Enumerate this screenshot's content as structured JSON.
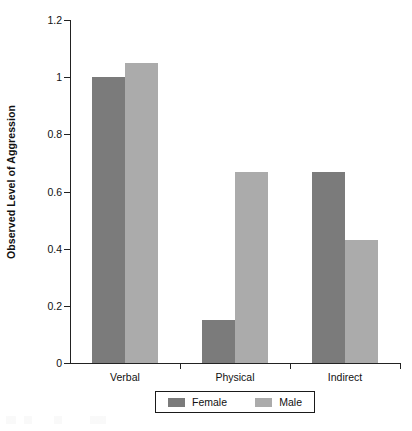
{
  "chart_data": {
    "type": "bar",
    "title": "",
    "subtitle": "",
    "xlabel": "",
    "ylabel": "Observed Level of Aggression",
    "categories": [
      "Verbal",
      "Physical",
      "Indirect"
    ],
    "series": [
      {
        "name": "Female",
        "color": "#7b7b7b",
        "values": [
          1.0,
          0.15,
          0.667
        ]
      },
      {
        "name": "Male",
        "color": "#ababab",
        "values": [
          1.05,
          0.667,
          0.43
        ]
      }
    ],
    "ylim": [
      0,
      1.2
    ],
    "yticks": [
      0,
      0.2,
      0.4,
      0.6,
      0.8,
      1,
      1.2
    ],
    "ytick_labels": [
      "0",
      "0.2",
      "0.4",
      "0.6",
      "0.8",
      "1",
      "1.2"
    ],
    "grid": false,
    "legend_position": "bottom-center",
    "legend": [
      "Female",
      "Male"
    ]
  },
  "colors": {
    "female": "#7b7b7b",
    "male": "#ababab",
    "axis": "#222222",
    "text": "#111111",
    "background": "#ffffff"
  }
}
